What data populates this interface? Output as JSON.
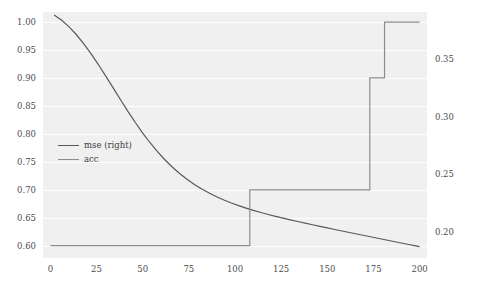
{
  "chart_data": {
    "type": "line",
    "title": "",
    "xlabel": "",
    "ylabel": "",
    "grid": true,
    "legend_position": "center-left",
    "xlim": [
      -4,
      204
    ],
    "xticks": [
      0,
      25,
      50,
      75,
      100,
      125,
      150,
      175,
      200
    ],
    "xticklabels": [
      "0",
      "25",
      "50",
      "75",
      "100",
      "125",
      "150",
      "175",
      "200"
    ],
    "left_axis": {
      "label": "acc",
      "ylim": [
        0.578,
        1.018
      ],
      "yticks": [
        0.6,
        0.65,
        0.7,
        0.75,
        0.8,
        0.85,
        0.9,
        0.95,
        1.0
      ],
      "yticklabels": [
        "0.60",
        "0.65",
        "0.70",
        "0.75",
        "0.80",
        "0.85",
        "0.90",
        "0.95",
        "1.00"
      ]
    },
    "right_axis": {
      "label": "mse",
      "ylim": [
        0.1775,
        0.3905
      ],
      "yticks": [
        0.2,
        0.25,
        0.3,
        0.35
      ],
      "yticklabels": [
        "0.20",
        "0.25",
        "0.30",
        "0.35"
      ]
    },
    "series": [
      {
        "name": "mse (right)",
        "axis": "right",
        "color": "#595959",
        "linewidth": 1.2,
        "x": [
          2,
          6,
          10,
          14,
          18,
          22,
          26,
          30,
          34,
          38,
          42,
          46,
          50,
          54,
          58,
          62,
          66,
          70,
          74,
          78,
          82,
          86,
          90,
          94,
          98,
          102,
          106,
          110,
          114,
          118,
          122,
          126,
          130,
          134,
          138,
          142,
          146,
          150,
          154,
          158,
          162,
          166,
          170,
          174,
          178,
          182,
          186,
          190,
          194,
          198,
          200
        ],
        "y": [
          0.388,
          0.3836,
          0.3778,
          0.371,
          0.3632,
          0.3545,
          0.345,
          0.335,
          0.3248,
          0.3145,
          0.3044,
          0.2948,
          0.2857,
          0.2773,
          0.2696,
          0.2626,
          0.2563,
          0.2507,
          0.2457,
          0.2412,
          0.2372,
          0.2337,
          0.2305,
          0.2277,
          0.2251,
          0.2228,
          0.2207,
          0.2187,
          0.2169,
          0.2152,
          0.2136,
          0.212,
          0.2105,
          0.2091,
          0.2077,
          0.2063,
          0.2049,
          0.2036,
          0.2022,
          0.2009,
          0.1996,
          0.1983,
          0.197,
          0.1957,
          0.1944,
          0.1931,
          0.1918,
          0.1905,
          0.1892,
          0.188,
          0.1874
        ]
      },
      {
        "name": "acc",
        "axis": "left",
        "color": "#8c8c8c",
        "linewidth": 1.2,
        "step": "post",
        "x": [
          0,
          108,
          108,
          173,
          173,
          181,
          181,
          200
        ],
        "y": [
          0.6,
          0.6,
          0.7,
          0.7,
          0.9,
          0.9,
          1.0,
          1.0
        ]
      }
    ]
  },
  "legend": {
    "entries": [
      {
        "label": "mse (right)",
        "color": "#595959"
      },
      {
        "label": "acc",
        "color": "#8c8c8c"
      }
    ]
  },
  "colors": {
    "plot_background": "#f0f0f0",
    "figure_background": "#ffffff",
    "gridline": "#ffffff",
    "tick_text": "#4d4d4d"
  }
}
